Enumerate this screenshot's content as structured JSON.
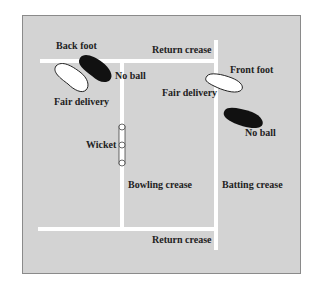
{
  "diagram": {
    "colors": {
      "field": "#d3d3d3",
      "border": "#8a8a8a",
      "lines": "#ffffff",
      "fair_foot": "#ffffff",
      "no_ball_foot": "#111111",
      "text": "#222222"
    },
    "labels": {
      "back_foot": "Back foot",
      "no_ball_back": "No ball",
      "fair_delivery_back": "Fair delivery",
      "return_crease_top": "Return crease",
      "front_foot": "Front foot",
      "fair_delivery_front": "Fair delivery",
      "no_ball_front": "No ball",
      "wicket": "Wicket",
      "bowling_crease": "Bowling crease",
      "batting_crease": "Batting crease",
      "return_crease_bottom": "Return crease"
    }
  }
}
